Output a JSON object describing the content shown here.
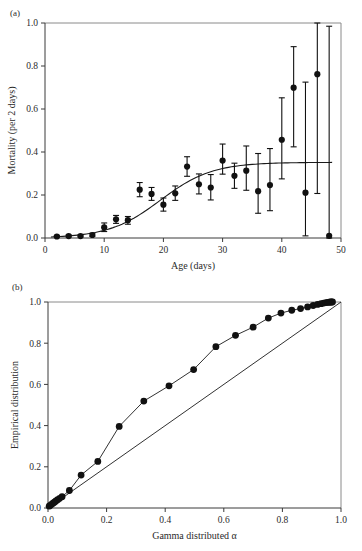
{
  "figure": {
    "panel_a_tag": "(a)",
    "panel_b_tag": "(b)"
  },
  "chart_data": [
    {
      "type": "scatter",
      "panel": "(a)",
      "title": "",
      "xlabel": "Age (days)",
      "ylabel": "Mortality (per 2 days)",
      "xlim": [
        0,
        50
      ],
      "ylim": [
        0.0,
        1.0
      ],
      "xticks": [
        0,
        10,
        20,
        30,
        40,
        50
      ],
      "xtick_labels": [
        "0",
        "10",
        "20",
        "30",
        "40",
        "50"
      ],
      "yticks": [
        0.0,
        0.2,
        0.4,
        0.6,
        0.8,
        1.0
      ],
      "ytick_labels": [
        "0.0",
        "0.2",
        "0.4",
        "0.6",
        "0.8",
        "1.0"
      ],
      "grid": false,
      "legend": "none",
      "x": [
        2,
        4,
        6,
        8,
        10,
        12,
        14,
        16,
        18,
        20,
        22,
        24,
        26,
        28,
        30,
        32,
        34,
        36,
        38,
        40,
        42,
        44,
        46,
        48
      ],
      "y": [
        0.007,
        0.009,
        0.009,
        0.014,
        0.049,
        0.087,
        0.083,
        0.225,
        0.205,
        0.155,
        0.208,
        0.332,
        0.25,
        0.235,
        0.36,
        0.289,
        0.313,
        0.218,
        0.246,
        0.457,
        0.699,
        0.211,
        0.762,
        0.01
      ],
      "yerr_low": [
        0.004,
        0.005,
        0.005,
        0.008,
        0.03,
        0.068,
        0.064,
        0.192,
        0.175,
        0.125,
        0.175,
        0.287,
        0.205,
        0.177,
        0.297,
        0.231,
        0.222,
        0.115,
        0.127,
        0.275,
        0.424,
        0.01,
        0.207,
        0.0
      ],
      "yerr_high": [
        0.012,
        0.014,
        0.014,
        0.022,
        0.07,
        0.105,
        0.1,
        0.258,
        0.235,
        0.186,
        0.242,
        0.378,
        0.298,
        0.295,
        0.437,
        0.348,
        0.428,
        0.393,
        0.416,
        0.652,
        0.89,
        0.725,
        1.0,
        0.985
      ],
      "fit_curve_label": "fitted mortality curve",
      "fit_curve_asymptote": 0.352,
      "series": [
        {
          "name": "observed mortality",
          "marker": "filled-circle",
          "color": "#111111"
        },
        {
          "name": "model fit",
          "marker": "line",
          "color": "#1a1a1a"
        }
      ]
    },
    {
      "type": "scatter",
      "panel": "(b)",
      "title": "",
      "xlabel": "Gamma distributed α",
      "ylabel": "Empirical distribution",
      "xlim": [
        0.0,
        1.0
      ],
      "ylim": [
        0.0,
        1.0
      ],
      "xticks": [
        0.0,
        0.2,
        0.4,
        0.6,
        0.8,
        1.0
      ],
      "xtick_labels": [
        "0.0",
        "0.2",
        "0.4",
        "0.6",
        "0.8",
        "1.0"
      ],
      "yticks": [
        0.0,
        0.2,
        0.4,
        0.6,
        0.8,
        1.0
      ],
      "ytick_labels": [
        "0.0",
        "0.2",
        "0.4",
        "0.6",
        "0.8",
        "1.0"
      ],
      "grid": false,
      "legend": "none",
      "x": [
        0.004,
        0.008,
        0.012,
        0.017,
        0.022,
        0.027,
        0.033,
        0.04,
        0.048,
        0.073,
        0.113,
        0.17,
        0.243,
        0.327,
        0.413,
        0.497,
        0.573,
        0.64,
        0.7,
        0.752,
        0.795,
        0.832,
        0.862,
        0.886,
        0.905,
        0.92,
        0.932,
        0.941,
        0.949,
        0.955,
        0.96,
        0.964,
        0.968,
        0.971
      ],
      "y": [
        0.009,
        0.013,
        0.018,
        0.023,
        0.028,
        0.034,
        0.04,
        0.047,
        0.055,
        0.085,
        0.16,
        0.226,
        0.396,
        0.519,
        0.593,
        0.672,
        0.783,
        0.838,
        0.878,
        0.922,
        0.946,
        0.96,
        0.968,
        0.976,
        0.983,
        0.988,
        0.992,
        0.995,
        0.997,
        0.998,
        0.999,
        1.0,
        1.0,
        1.0
      ],
      "series": [
        {
          "name": "empirical vs gamma quantiles",
          "marker": "filled-circle-connected",
          "color": "#111111"
        },
        {
          "name": "1:1 reference line",
          "marker": "line",
          "color": "#1a1a1a"
        }
      ],
      "reference_line": {
        "from": [
          0.0,
          0.0
        ],
        "to": [
          1.0,
          1.0
        ],
        "label": "y = x"
      }
    }
  ]
}
